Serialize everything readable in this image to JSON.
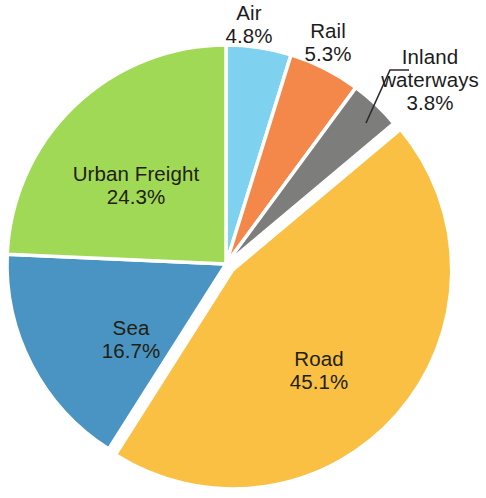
{
  "chart_data": {
    "type": "pie",
    "title": "",
    "subtitle": "",
    "xlabel": "",
    "ylabel": "",
    "legend_position": "none",
    "grid": false,
    "value_unit": "%",
    "start_angle_deg": 0,
    "direction": "clockwise",
    "categories": [
      "Air",
      "Rail",
      "Inland waterways",
      "Road",
      "Sea",
      "Urban Freight"
    ],
    "values": [
      4.8,
      5.3,
      3.8,
      45.1,
      16.7,
      24.3
    ],
    "slices": [
      {
        "name": "Air",
        "label": "Air",
        "value": 4.8,
        "value_label": "4.8%",
        "color": "#7ED2EF",
        "label_placement": "outside",
        "exploded": false,
        "leader_line": false
      },
      {
        "name": "Rail",
        "label": "Rail",
        "value": 5.3,
        "value_label": "5.3%",
        "color": "#F4874A",
        "label_placement": "outside",
        "exploded": false,
        "leader_line": false
      },
      {
        "name": "Inland waterways",
        "label": "Inland waterways",
        "label_line1": "Inland",
        "label_line2": "waterways",
        "value": 3.8,
        "value_label": "3.8%",
        "color": "#7D7D7B",
        "label_placement": "outside",
        "exploded": false,
        "leader_line": true
      },
      {
        "name": "Road",
        "label": "Road",
        "value": 45.1,
        "value_label": "45.1%",
        "color": "#F9C043",
        "label_placement": "inside",
        "exploded": true,
        "leader_line": false
      },
      {
        "name": "Sea",
        "label": "Sea",
        "value": 16.7,
        "value_label": "16.7%",
        "color": "#4A94C4",
        "label_placement": "inside",
        "exploded": false,
        "leader_line": false
      },
      {
        "name": "Urban Freight",
        "label": "Urban Freight",
        "value": 24.3,
        "value_label": "24.3%",
        "color": "#9FD955",
        "label_placement": "inside",
        "exploded": false,
        "leader_line": false
      }
    ],
    "total": 100.0,
    "colors": {
      "air": "#7ED2EF",
      "rail": "#F4874A",
      "inland_waterways": "#7D7D7B",
      "road": "#F9C043",
      "sea": "#4A94C4",
      "urban_freight": "#9FD955",
      "slice_border": "#FFFFFF",
      "label_text": "#1C1C1C",
      "leader_line": "#2B2B2B",
      "background": "#FFFFFF"
    }
  }
}
